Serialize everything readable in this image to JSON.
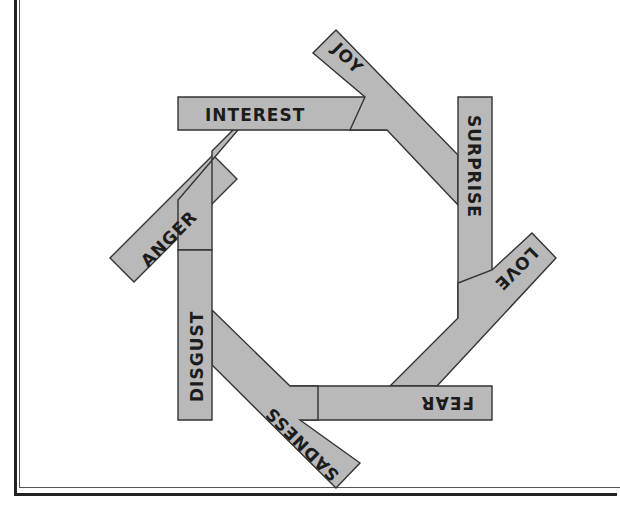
{
  "diagram": {
    "type": "emotion-wheel",
    "shape": "octagon",
    "fill_color": "#b9b9b9",
    "stroke_color": "#333333",
    "emotions": [
      {
        "label": "INTEREST",
        "position": "top"
      },
      {
        "label": "JOY",
        "position": "top-right"
      },
      {
        "label": "SURPRISE",
        "position": "right"
      },
      {
        "label": "LOVE",
        "position": "bottom-right"
      },
      {
        "label": "FEAR",
        "position": "bottom"
      },
      {
        "label": "SADNESS",
        "position": "bottom-left"
      },
      {
        "label": "DISGUST",
        "position": "left"
      },
      {
        "label": "ANGER",
        "position": "top-left"
      }
    ]
  }
}
